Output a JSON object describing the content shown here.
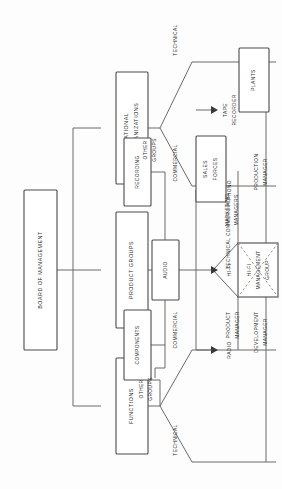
{
  "diagram": {
    "orientation": "rotated-90-ccw",
    "colors": {
      "box_stroke": "#4a4a4a",
      "line": "#6a6a6a",
      "dashed_line": "#8a8a8a",
      "text": "#2b2b2b",
      "background": "#fdfdfd"
    },
    "boxes": {
      "board": "BOARD OF MANAGEMENT",
      "product_groups": "PRODUCT GROUPS",
      "national_organizations_1": "NATIONAL",
      "national_organizations_2": "ORGANIZATIONS",
      "functions": "FUNCTIONS",
      "components": "COMPONENTS",
      "audio": "AUDIO",
      "recording": "RECORDING",
      "sales_forces_1": "SALES",
      "sales_forces_2": "FORCES",
      "plants": "PLANTS",
      "hifi_group_1": "HI-FI",
      "hifi_group_2": "MANAGEMENT",
      "hifi_group_3": "GROUP"
    },
    "labels": {
      "other_groups_pg_1": "OTHER",
      "other_groups_pg_2": "GROUPS",
      "other_groups_fn_1": "OTHER",
      "other_groups_fn_2": "GROUPS",
      "radio": "RADIO",
      "phono": "PHONO",
      "hifi": "HI-FI",
      "tape_1": "TAPE",
      "tape_2": "RECORDER",
      "no_technical": "TECHNICAL",
      "no_commercial": "COMMERCIAL",
      "fn_commercial": "COMMERCIAL",
      "fn_technical": "TECHNICAL",
      "tech_commercial": "TECHNICAL COMMERCIAL",
      "marketing_1": "MARKETING",
      "marketing_2": "MANAGERS",
      "production_1": "PRODUCTION",
      "production_2": "MANAGER",
      "product_mgr_1": "PRODUCT",
      "product_mgr_2": "MANAGER",
      "development_1": "DEVELOPMENT",
      "development_2": "MANAGER"
    }
  }
}
